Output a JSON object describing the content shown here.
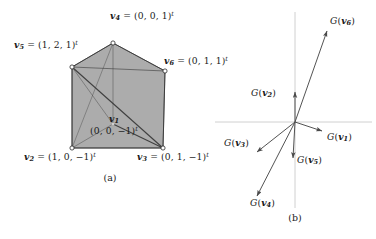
{
  "figure": {
    "panels": [
      {
        "id": "a",
        "caption": "(a)",
        "caption_pos": [
          95,
          170
        ],
        "type": "polyhedron-projection",
        "fill_color": "#a8a8a8",
        "stroke_color": "#333333",
        "vertices": [
          {
            "name": "v",
            "sub": "1",
            "coords": "(0, 0, −1)",
            "sup": "t",
            "px": [
              113,
              124
            ],
            "label_pos": [
              113,
              114
            ],
            "label_mode": "two-line",
            "marker": true
          },
          {
            "name": "v",
            "sub": "2",
            "coords": "(1, 0, −1)",
            "sup": "t",
            "px": [
              72,
              148
            ],
            "label_pos": [
              24,
              152
            ],
            "label_mode": "inline",
            "marker": true
          },
          {
            "name": "v",
            "sub": "3",
            "coords": "(0, 1, −1)",
            "sup": "t",
            "px": [
              163,
              148
            ],
            "label_pos": [
              137,
              152
            ],
            "label_mode": "inline",
            "marker": true
          },
          {
            "name": "v",
            "sub": "4",
            "coords": "(0, 0, 1)",
            "sup": "t",
            "px": [
              113,
              43
            ],
            "label_pos": [
              110,
              11
            ],
            "label_mode": "inline",
            "marker": true
          },
          {
            "name": "v",
            "sub": "5",
            "coords": "(1, 2, 1)",
            "sup": "t",
            "px": [
              72,
              67
            ],
            "label_pos": [
              14,
              40
            ],
            "label_mode": "inline",
            "marker": true
          },
          {
            "name": "v",
            "sub": "6",
            "coords": "(0, 1, 1)",
            "sup": "t",
            "px": [
              165,
              71
            ],
            "label_pos": [
              164,
              56
            ],
            "label_mode": "inline",
            "marker": true
          }
        ],
        "outline_path": "M113,43 L165,71 L163,148 L72,148 L72,67 Z",
        "edges": [
          [
            113,
            43,
            72,
            67
          ],
          [
            113,
            43,
            165,
            71
          ],
          [
            72,
            67,
            165,
            71
          ],
          [
            72,
            67,
            72,
            148
          ],
          [
            165,
            71,
            163,
            148
          ],
          [
            72,
            148,
            163,
            148
          ],
          [
            113,
            43,
            113,
            124
          ],
          [
            72,
            67,
            113,
            124
          ],
          [
            113,
            124,
            72,
            148
          ],
          [
            113,
            124,
            163,
            148
          ],
          [
            72,
            67,
            163,
            148
          ],
          [
            113,
            43,
            72,
            148
          ]
        ]
      },
      {
        "id": "b",
        "caption": "(b)",
        "caption_pos": [
          295,
          214
        ],
        "type": "vector-diagram",
        "axis_color": "#bdbdbd",
        "arrow_color": "#4a4a4a",
        "origin": [
          295,
          122
        ],
        "axes": {
          "x": [
            215,
            122,
            372,
            122
          ],
          "y": [
            295,
            12,
            295,
            208
          ]
        },
        "vectors": [
          {
            "label_name": "G",
            "arg": "v",
            "sub": "1",
            "tip": [
              322,
              131
            ],
            "label_pos": [
              327,
              132
            ]
          },
          {
            "label_name": "G",
            "arg": "v",
            "sub": "2",
            "tip": [
              295,
              92
            ],
            "label_pos": [
              255,
              90
            ]
          },
          {
            "label_name": "G",
            "arg": "v",
            "sub": "3",
            "tip": [
              257,
              152
            ],
            "label_pos": [
              227,
              140
            ]
          },
          {
            "label_name": "G",
            "arg": "v",
            "sub": "4",
            "tip": [
              257,
              196
            ],
            "label_pos": [
              253,
              196
            ]
          },
          {
            "label_name": "G",
            "arg": "v",
            "sub": "5",
            "tip": [
              293,
              158
            ],
            "label_pos": [
              297,
              157
            ]
          },
          {
            "label_name": "G",
            "arg": "v",
            "sub": "6",
            "tip": [
              327,
              31
            ],
            "label_pos": [
              330,
              18
            ]
          }
        ]
      }
    ]
  }
}
